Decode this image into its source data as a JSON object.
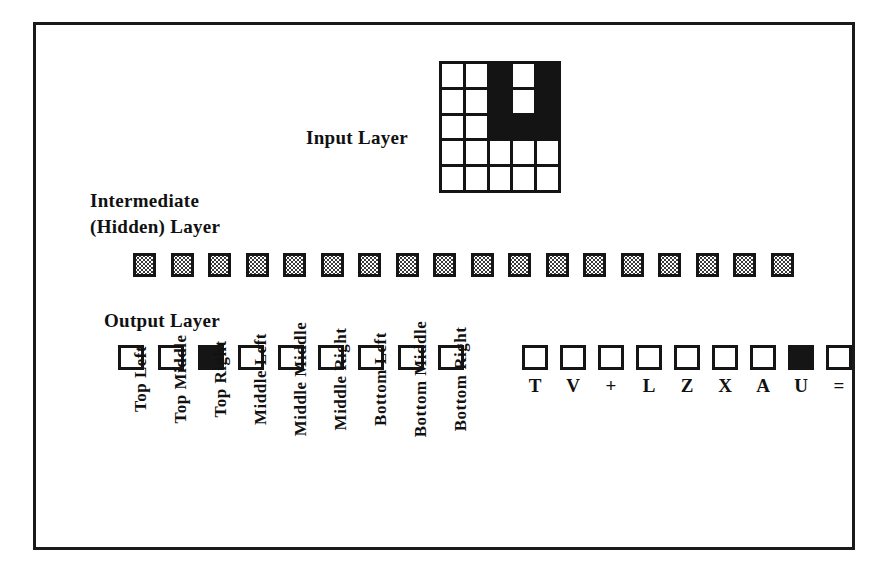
{
  "figure": {
    "labels": {
      "input_layer": "Input Layer",
      "hidden_layer_line1": "Intermediate",
      "hidden_layer_line2": "(Hidden) Layer",
      "output_layer": "Output Layer"
    },
    "colors": {
      "ink": "#151515",
      "paper": "#ffffff",
      "hidden_fill": "#3a3a3a"
    }
  },
  "input_layer": {
    "rows": 5,
    "cols": 5,
    "cells": [
      [
        0,
        0,
        1,
        0,
        1
      ],
      [
        0,
        0,
        1,
        0,
        1
      ],
      [
        0,
        0,
        1,
        1,
        1
      ],
      [
        0,
        0,
        0,
        0,
        0
      ],
      [
        0,
        0,
        0,
        0,
        0
      ]
    ]
  },
  "hidden_layer": {
    "count": 18,
    "units": [
      {
        "index": 1,
        "state": "partial"
      },
      {
        "index": 2,
        "state": "partial"
      },
      {
        "index": 3,
        "state": "partial"
      },
      {
        "index": 4,
        "state": "partial"
      },
      {
        "index": 5,
        "state": "partial"
      },
      {
        "index": 6,
        "state": "partial"
      },
      {
        "index": 7,
        "state": "partial"
      },
      {
        "index": 8,
        "state": "partial"
      },
      {
        "index": 9,
        "state": "partial"
      },
      {
        "index": 10,
        "state": "partial"
      },
      {
        "index": 11,
        "state": "partial"
      },
      {
        "index": 12,
        "state": "partial"
      },
      {
        "index": 13,
        "state": "partial"
      },
      {
        "index": 14,
        "state": "partial"
      },
      {
        "index": 15,
        "state": "partial"
      },
      {
        "index": 16,
        "state": "partial"
      },
      {
        "index": 17,
        "state": "partial"
      },
      {
        "index": 18,
        "state": "partial"
      }
    ]
  },
  "output_layer": {
    "position_group": {
      "count": 9,
      "units": [
        {
          "label": "Top Left",
          "on": false
        },
        {
          "label": "Top Middle",
          "on": false
        },
        {
          "label": "Top Right",
          "on": true
        },
        {
          "label": "Middle Left",
          "on": false
        },
        {
          "label": "Middle Middle",
          "on": false
        },
        {
          "label": "Middle Right",
          "on": false
        },
        {
          "label": "Bottom Left",
          "on": false
        },
        {
          "label": "Bottom Middle",
          "on": false
        },
        {
          "label": "Bottom Right",
          "on": false
        }
      ]
    },
    "symbol_group": {
      "count": 9,
      "units": [
        {
          "label": "T",
          "on": false
        },
        {
          "label": "V",
          "on": false
        },
        {
          "label": "+",
          "on": false
        },
        {
          "label": "L",
          "on": false
        },
        {
          "label": "Z",
          "on": false
        },
        {
          "label": "X",
          "on": false
        },
        {
          "label": "A",
          "on": false
        },
        {
          "label": "U",
          "on": true
        },
        {
          "label": "=",
          "on": false
        }
      ]
    }
  }
}
